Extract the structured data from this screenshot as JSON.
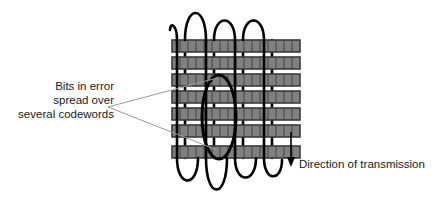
{
  "diagram": {
    "labels": {
      "error_line1": "Bits in error",
      "error_line2": "spread over",
      "error_line3": "several codewords",
      "direction": "Direction of transmission"
    },
    "colors": {
      "cell_fill": "#808080",
      "cell_border": "#3b3b3b",
      "coil_stroke": "#000000",
      "leader_stroke": "#9a9a9a",
      "text": "#1a1a1a",
      "background": "#ffffff"
    },
    "grid": {
      "rows": 7,
      "columns": 16,
      "left": 172,
      "top": 40,
      "width": 128,
      "row_height": 12,
      "row_pitch": 17
    },
    "coil": {
      "loops": 4,
      "description": "helical transmission path winding through the codeword block"
    },
    "highlight_ellipse": {
      "cx": 219,
      "cy": 117,
      "rx": 17,
      "ry": 42,
      "description": "burst error region spanning several codewords"
    },
    "arrow": {
      "x": 291,
      "from_y": 132,
      "to_y": 166,
      "direction": "down"
    }
  }
}
